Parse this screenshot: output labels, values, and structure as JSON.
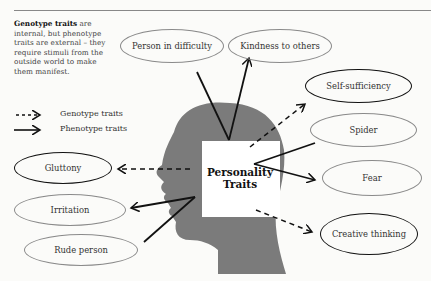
{
  "caption": {
    "bold": "Genotype traits",
    "rest": " are internal, but phenotype traits are external – they require stimuli from the outside world to make them manifest."
  },
  "legend": [
    {
      "label": "Genotype traits",
      "line": "dashed"
    },
    {
      "label": "Phenotype traits",
      "line": "solid"
    }
  ],
  "center": {
    "line1": "Personality",
    "line2": "Traits"
  },
  "nodes": {
    "person_in_difficulty": {
      "label": "Person in difficulty",
      "outline": "gray"
    },
    "kindness_to_others": {
      "label": "Kindness to others",
      "outline": "gray"
    },
    "self_sufficiency": {
      "label": "Self-sufficiency",
      "outline": "black"
    },
    "spider": {
      "label": "Spider",
      "outline": "gray"
    },
    "fear": {
      "label": "Fear",
      "outline": "gray"
    },
    "creative_thinking": {
      "label": "Creative thinking",
      "outline": "black"
    },
    "gluttony": {
      "label": "Gluttony",
      "outline": "black"
    },
    "irritation": {
      "label": "Irritation",
      "outline": "gray"
    },
    "rude_person": {
      "label": "Rude person",
      "outline": "gray"
    }
  },
  "colors": {
    "head": "#7b7b7b",
    "box": "#ffffff",
    "arrow": "#111111",
    "gray_outline": "#8a8a8a"
  }
}
